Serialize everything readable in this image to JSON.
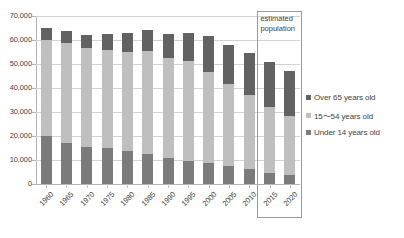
{
  "chart_data": {
    "type": "bar",
    "subtype": "stacked-column",
    "title": "",
    "xlabel": "",
    "ylabel": "",
    "ylim": [
      0,
      70000
    ],
    "ytick_step": 10000,
    "ytick_labels": [
      "70,000",
      "60,000",
      "50,000",
      "40,000",
      "30,000",
      "20,000",
      "10,000",
      "0"
    ],
    "ytick_values": [
      70000,
      60000,
      50000,
      40000,
      30000,
      20000,
      10000,
      0
    ],
    "grid": true,
    "grid_axis": "y",
    "legend_position": "right",
    "categories": [
      "1960",
      "1965",
      "1970",
      "1975",
      "1980",
      "1985",
      "1990",
      "1995",
      "2000",
      "2005",
      "2010",
      "2015",
      "2020"
    ],
    "series": [
      {
        "name": "Under 14 years old",
        "color": "#7b7b7b",
        "values": [
          20000,
          17200,
          15500,
          15000,
          13900,
          12500,
          10800,
          9700,
          8800,
          7300,
          6100,
          4700,
          3700
        ]
      },
      {
        "name": "15〜54 years old",
        "color": "#bfbfbf",
        "values": [
          40000,
          41400,
          41000,
          41000,
          41200,
          42800,
          41900,
          41400,
          38000,
          34500,
          30800,
          27400,
          24800
        ]
      },
      {
        "name": "Over 65 years old",
        "color": "#626262",
        "values": [
          5200,
          5000,
          5500,
          6500,
          8000,
          8700,
          10000,
          11800,
          14700,
          16300,
          17600,
          18800,
          18500
        ]
      }
    ],
    "totals": [
      65200,
      63600,
      62000,
      62500,
      63100,
      64000,
      62700,
      62900,
      61500,
      58100,
      54500,
      50900,
      47000
    ],
    "annotations": [
      {
        "name": "estimated-population",
        "text": "estimated population",
        "covers_categories": [
          "2015",
          "2020"
        ]
      }
    ]
  },
  "legend": {
    "items": [
      {
        "label": "Over 65 years old",
        "color": "#626262"
      },
      {
        "label": "15〜54 years old",
        "color": "#bfbfbf"
      },
      {
        "label": "Under 14 years old",
        "color": "#7b7b7b"
      }
    ]
  },
  "annotation": {
    "estimated_text": "estimated population"
  }
}
